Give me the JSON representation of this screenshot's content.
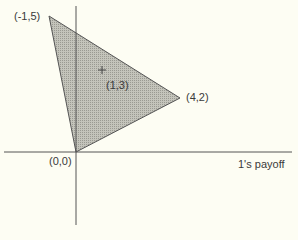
{
  "figure": {
    "vertices": [
      {
        "label": "(-1,5)",
        "x": -1,
        "y": 5
      },
      {
        "label": "(4,2)",
        "x": 4,
        "y": 2
      },
      {
        "label": "(0,0)",
        "x": 0,
        "y": 0
      }
    ],
    "interior_point": {
      "label": "(1,3)",
      "marker": "+",
      "x": 1,
      "y": 3
    },
    "x_axis_label": "1's payoff",
    "region_fill": "#b8b8b0",
    "axis_color": "#555555"
  },
  "caption": ""
}
